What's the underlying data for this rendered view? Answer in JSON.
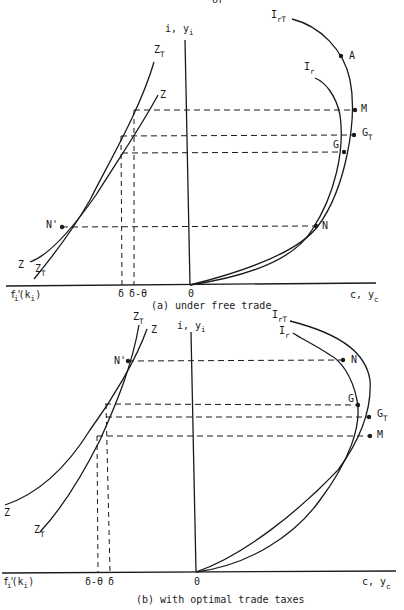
{
  "header_fragment": "or",
  "panels": [
    {
      "id": "a",
      "caption": "(a) under free trade",
      "y_axis_label": "i, y",
      "y_axis_sub": "i",
      "x_axis_right_label": "c, y",
      "x_axis_right_sub": "c",
      "x_axis_left_label": "f'",
      "x_axis_left_label_rest": "(k",
      "x_axis_left_sub": "i",
      "origin_label": "0",
      "tick_labels": [
        "δ",
        "δ-θ"
      ],
      "curves_left": [
        {
          "name": "Z",
          "sub": ""
        },
        {
          "name": "Z",
          "sub": "T"
        }
      ],
      "curves_right": [
        {
          "name": "I",
          "sub": "rT"
        },
        {
          "name": "I",
          "sub": "r"
        }
      ],
      "points": [
        "A",
        "M",
        "G",
        "N",
        "N'"
      ],
      "point_G_T": {
        "name": "G",
        "sub": "T"
      }
    },
    {
      "id": "b",
      "caption": "(b) with optimal trade taxes",
      "y_axis_label": "i, y",
      "y_axis_sub": "i",
      "x_axis_right_label": "c, y",
      "x_axis_right_sub": "c",
      "x_axis_left_label": "f'",
      "x_axis_left_label_rest": "(k",
      "x_axis_left_sub": "i",
      "origin_label": "0",
      "tick_labels": [
        "δ-θ",
        "δ"
      ],
      "curves_left": [
        {
          "name": "Z",
          "sub": "T"
        },
        {
          "name": "Z",
          "sub": ""
        }
      ],
      "curves_right": [
        {
          "name": "I",
          "sub": "rT"
        },
        {
          "name": "I",
          "sub": "r"
        }
      ],
      "points": [
        "N",
        "N'",
        "G",
        "M"
      ],
      "point_G_T": {
        "name": "G",
        "sub": "T"
      }
    }
  ]
}
